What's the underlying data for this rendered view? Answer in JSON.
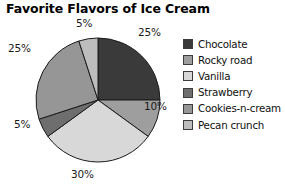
{
  "chart_data": {
    "type": "pie",
    "title": "Favorite Flavors of Ice Cream",
    "categories": [
      "Chocolate",
      "Rocky road",
      "Vanilla",
      "Strawberry",
      "Cookies-n-cream",
      "Pecan crunch"
    ],
    "values": [
      25,
      10,
      30,
      5,
      25,
      5
    ],
    "value_labels": [
      "25%",
      "10%",
      "30%",
      "5%",
      "25%",
      "5%"
    ],
    "colors": [
      "#3a3a3a",
      "#9e9e9e",
      "#d8d8d8",
      "#6e6e6e",
      "#969696",
      "#bdbdbd"
    ],
    "slice_border_color": "#1a1a1a",
    "start_angle_deg": 0,
    "direction": "clockwise",
    "legend_position": "right",
    "grid": false,
    "xlabel": "",
    "ylabel": ""
  },
  "labels": {
    "chocolate_pct": "25%",
    "rocky_road_pct": "10%",
    "vanilla_pct": "30%",
    "strawberry_pct": "5%",
    "cookies_pct": "25%",
    "pecan_pct": "5%"
  }
}
